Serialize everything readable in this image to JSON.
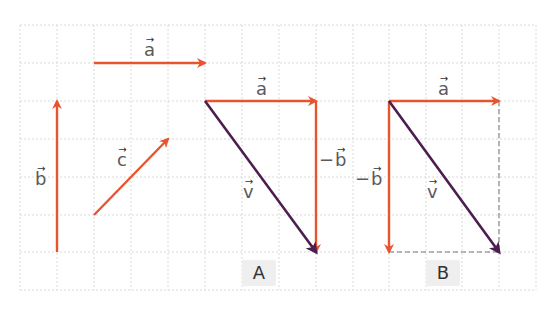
{
  "colors": {
    "vector": "#e8542e",
    "resultant": "#4b1e4f",
    "grid": "#cfcfcf",
    "label_text": "#5a5a5a",
    "panel_bg": "#efefef"
  },
  "grid": {
    "x_lines": [
      20,
      57,
      94,
      131,
      168,
      205,
      242,
      279,
      316,
      353,
      389,
      426,
      462,
      499,
      536
    ],
    "y_lines": [
      25,
      63,
      101,
      139,
      177,
      215,
      252,
      290
    ]
  },
  "vectors": [
    {
      "id": "a-standalone",
      "x1": 94,
      "y1": 63,
      "x2": 205,
      "y2": 63,
      "color": "vector"
    },
    {
      "id": "b-standalone",
      "x1": 57,
      "y1": 252,
      "x2": 57,
      "y2": 101,
      "color": "vector"
    },
    {
      "id": "c-standalone",
      "x1": 94,
      "y1": 215,
      "x2": 168,
      "y2": 139,
      "color": "vector"
    },
    {
      "id": "a-figA",
      "x1": 205,
      "y1": 101,
      "x2": 316,
      "y2": 101,
      "color": "vector"
    },
    {
      "id": "neg-b-figA",
      "x1": 316,
      "y1": 101,
      "x2": 316,
      "y2": 252,
      "color": "vector"
    },
    {
      "id": "v-figA",
      "x1": 205,
      "y1": 101,
      "x2": 316,
      "y2": 252,
      "color": "resultant"
    },
    {
      "id": "a-figB",
      "x1": 389,
      "y1": 101,
      "x2": 499,
      "y2": 101,
      "color": "vector"
    },
    {
      "id": "neg-b-figB",
      "x1": 389,
      "y1": 101,
      "x2": 389,
      "y2": 252,
      "color": "vector"
    },
    {
      "id": "v-figB",
      "x1": 389,
      "y1": 101,
      "x2": 499,
      "y2": 252,
      "color": "resultant"
    }
  ],
  "dashed_lines": [
    {
      "id": "figB-right",
      "x1": 499,
      "y1": 101,
      "x2": 499,
      "y2": 252
    },
    {
      "id": "figB-bottom",
      "x1": 389,
      "y1": 252,
      "x2": 499,
      "y2": 252
    }
  ],
  "labels": {
    "a_standalone": {
      "minus": "",
      "sym": "a",
      "arrow": "→"
    },
    "b_standalone": {
      "minus": "",
      "sym": "b",
      "arrow": "→"
    },
    "c_standalone": {
      "minus": "",
      "sym": "c",
      "arrow": "→"
    },
    "a_figA": {
      "minus": "",
      "sym": "a",
      "arrow": "→"
    },
    "neg_b_figA": {
      "minus": "−",
      "sym": "b",
      "arrow": "→"
    },
    "v_figA": {
      "minus": "",
      "sym": "v",
      "arrow": "→"
    },
    "a_figB": {
      "minus": "",
      "sym": "a",
      "arrow": "→"
    },
    "neg_b_figB": {
      "minus": "−",
      "sym": "b",
      "arrow": "→"
    },
    "v_figB": {
      "minus": "",
      "sym": "v",
      "arrow": "→"
    }
  },
  "panels": {
    "A": "A",
    "B": "B"
  }
}
